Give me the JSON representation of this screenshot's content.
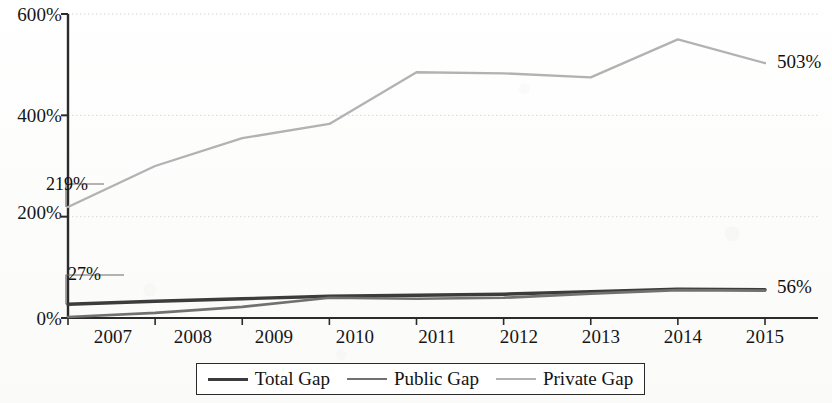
{
  "chart_data": {
    "type": "line",
    "title": "",
    "subtitle": "",
    "xlabel": "",
    "ylabel": "",
    "categories": [
      "2007",
      "2008",
      "2009",
      "2010",
      "2011",
      "2012",
      "2013",
      "2014",
      "2015"
    ],
    "x": [
      2007,
      2008,
      2009,
      2010,
      2011,
      2012,
      2013,
      2014,
      2015
    ],
    "xlim": [
      2007,
      2015
    ],
    "ylim": [
      0,
      600
    ],
    "y_tick_labels": [
      "0%",
      "200%",
      "400%",
      "600%"
    ],
    "y_tick_values": [
      0,
      200,
      400,
      600
    ],
    "grid": true,
    "grid_axis": "y",
    "legend_position": "bottom",
    "value_suffix": "%",
    "series": [
      {
        "name": "Total Gap",
        "color": "#3c3c3c",
        "values": [
          27,
          33,
          38,
          43,
          45,
          47,
          52,
          57,
          56
        ]
      },
      {
        "name": "Public Gap",
        "color": "#717171",
        "values": [
          2,
          10,
          22,
          40,
          38,
          40,
          48,
          55,
          54
        ]
      },
      {
        "name": "Private Gap",
        "color": "#b2b2b2",
        "values": [
          219,
          300,
          355,
          383,
          485,
          483,
          475,
          550,
          503
        ]
      }
    ],
    "annotations": [
      {
        "text": "219%",
        "series": "Private Gap",
        "x": "2007",
        "value": 219,
        "placement": "left"
      },
      {
        "text": "27%",
        "series": "Total Gap",
        "x": "2007",
        "value": 27,
        "placement": "left"
      },
      {
        "text": "503%",
        "series": "Private Gap",
        "x": "2015",
        "value": 503,
        "placement": "right"
      },
      {
        "text": "56%",
        "series": "Total Gap",
        "x": "2015",
        "value": 56,
        "placement": "right"
      }
    ]
  },
  "axes": {
    "y_ticks": [
      {
        "label": "600%"
      },
      {
        "label": "400%"
      },
      {
        "label": "200%"
      },
      {
        "label": "0%"
      }
    ],
    "x_ticks": [
      {
        "label": "2007"
      },
      {
        "label": "2008"
      },
      {
        "label": "2009"
      },
      {
        "label": "2010"
      },
      {
        "label": "2011"
      },
      {
        "label": "2012"
      },
      {
        "label": "2013"
      },
      {
        "label": "2014"
      },
      {
        "label": "2015"
      }
    ]
  },
  "annotations": {
    "private_start": "219%",
    "total_start": "27%",
    "private_end": "503%",
    "total_end": "56%"
  },
  "legend": {
    "items": [
      {
        "label": "Total Gap",
        "color": "#3c3c3c",
        "thickness": "3.2px"
      },
      {
        "label": "Public Gap",
        "color": "#717171",
        "thickness": "2.6px"
      },
      {
        "label": "Private Gap",
        "color": "#b2b2b2",
        "thickness": "2.2px"
      }
    ]
  },
  "colors": {
    "total_gap": "#3c3c3c",
    "public_gap": "#717171",
    "private_gap": "#b2b2b2",
    "axis": "#2b2b2b",
    "grid": "#d8d8d8",
    "text": "#101010",
    "background": "#fdfdfc"
  }
}
